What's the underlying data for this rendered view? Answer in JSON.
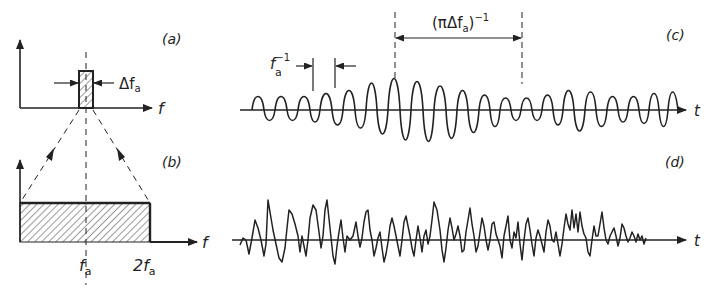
{
  "panels": {
    "a": {
      "label": "(a)",
      "x_axis_label": "f",
      "bandwidth_label": "Δf",
      "bandwidth_sub": "a"
    },
    "b": {
      "label": "(b)",
      "x_axis_label": "f",
      "tick_1": "f",
      "tick_1_sub": "a",
      "tick_2": "2f",
      "tick_2_sub": "a"
    },
    "c": {
      "label": "(c)",
      "x_axis_label": "t",
      "period_label": "f",
      "period_sub": "a",
      "period_sup": "−1",
      "envelope_label": "(πΔf",
      "envelope_sub": "a",
      "envelope_close": ")",
      "envelope_sup": "−1"
    },
    "d": {
      "label": "(d)",
      "x_axis_label": "t"
    }
  },
  "colors": {
    "ink": "#222222",
    "background": "#ffffff"
  }
}
